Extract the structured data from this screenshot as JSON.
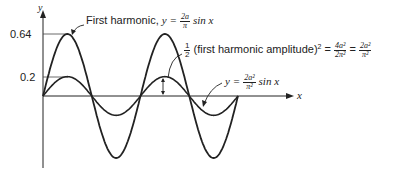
{
  "chart_data": {
    "type": "line",
    "title": "",
    "xlabel": "x",
    "ylabel": "y",
    "ytick_labels": [
      "0.64",
      "0.2"
    ],
    "yticks": [
      0.64,
      0.2
    ],
    "x_range": [
      0,
      12.566
    ],
    "grid": false,
    "series": [
      {
        "name": "First harmonic, y = 2a/π sin x",
        "amplitude": 0.64,
        "function": "0.64 sin x"
      },
      {
        "name": "y = 2a²/π² sin x",
        "amplitude": 0.2,
        "function": "0.2 sin x"
      }
    ],
    "annotations": [
      "First harmonic, y = 2a/π sin x",
      "½ (first harmonic amplitude)² = 4a²/2π² = 2a²/π²",
      "y = 2a²/π² sin x"
    ]
  },
  "labels": {
    "y_axis": "y",
    "x_axis": "x",
    "tick_064": "0.64",
    "tick_02": "0.2",
    "first_harmonic_prefix": "First harmonic,",
    "y_eq": "y =",
    "frac1_num": "2a",
    "frac1_den": "π",
    "sinx": "sin x",
    "half_num": "1",
    "half_den": "2",
    "amp_text": "(first harmonic amplitude)",
    "sq": "2",
    "eq": "=",
    "frac2_num": "4a²",
    "frac2_den": "2π²",
    "frac3_num": "2a²",
    "frac3_den": "π²",
    "frac4_num": "2a²",
    "frac4_den": "π²"
  }
}
